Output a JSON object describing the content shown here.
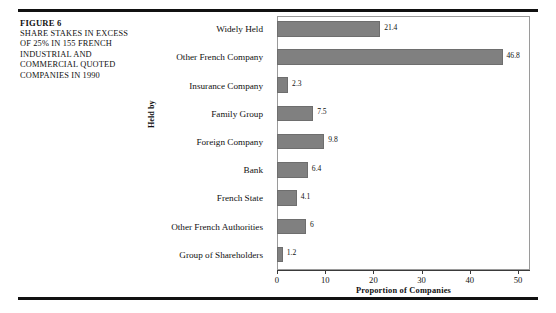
{
  "figure": {
    "number_label": "FIGURE 6",
    "caption_lines": [
      "SHARE STAKES IN EXCESS",
      "OF 25% IN 155 FRENCH",
      "INDUSTRIAL AND",
      "COMMERCIAL QUOTED",
      "COMPANIES IN 1990"
    ]
  },
  "colors": {
    "bar_fill": "#808080",
    "bar_stroke": "#6e6e6e",
    "frame": "#9a9a9a",
    "rule": "#111111",
    "text": "#111111",
    "background": "#ffffff"
  },
  "chart_data": {
    "type": "bar",
    "orientation": "horizontal",
    "title": "",
    "subtitle": "",
    "xlabel": "Proportion of Companies",
    "ylabel": "Held by",
    "xlim": [
      0,
      52.5
    ],
    "xticks": [
      0,
      10,
      20,
      30,
      40,
      50
    ],
    "xtick_labels": [
      "0",
      "10",
      "20",
      "30",
      "40",
      "50"
    ],
    "grid": false,
    "legend": null,
    "value_labels": true,
    "categories": [
      "Widely Held",
      "Other French Company",
      "Insurance Company",
      "Family Group",
      "Foreign Company",
      "Bank",
      "French State",
      "Other French Authorities",
      "Group of Shareholders"
    ],
    "values": [
      21.4,
      46.8,
      2.3,
      7.5,
      9.8,
      6.4,
      4.1,
      6,
      1.2
    ],
    "value_labels_text": [
      "21.4",
      "46.8",
      "2.3",
      "7.5",
      "9.8",
      "6.4",
      "4.1",
      "6",
      "1.2"
    ]
  }
}
